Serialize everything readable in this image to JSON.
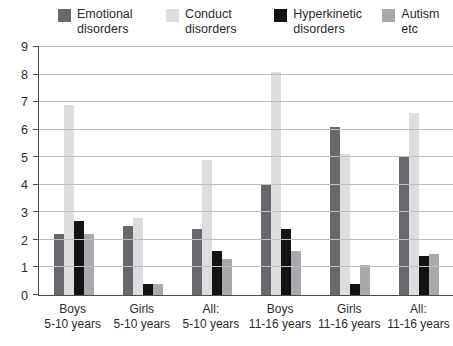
{
  "figure": {
    "background": "#ffffff",
    "text_color": "#2b2b2b",
    "grid_color": "#bdbfc1",
    "axis_color": "#4c4c4e"
  },
  "chart_data": {
    "type": "bar",
    "title": "",
    "xlabel": "",
    "ylabel": "",
    "grid": true,
    "legend_position": "top",
    "ylim": [
      0,
      9
    ],
    "yticks": [
      0,
      1,
      2,
      3,
      4,
      5,
      6,
      7,
      8,
      9
    ],
    "categories": [
      [
        "Boys",
        "5-10 years"
      ],
      [
        "Girls",
        "5-10 years"
      ],
      [
        "All:",
        "5-10 years"
      ],
      [
        "Boys",
        "11-16 years"
      ],
      [
        "Girls",
        "11-16 years"
      ],
      [
        "All:",
        "11-16 years"
      ]
    ],
    "series": [
      {
        "name": "Emotional disorders",
        "color": "#67696c",
        "values": [
          2.2,
          2.5,
          2.4,
          4.0,
          6.1,
          5.0
        ]
      },
      {
        "name": "Conduct disorders",
        "color": "#dcddde",
        "values": [
          6.9,
          2.8,
          4.9,
          8.1,
          5.1,
          6.6
        ]
      },
      {
        "name": "Hyperkinetic disorders",
        "color": "#131313",
        "values": [
          2.7,
          0.4,
          1.6,
          2.4,
          0.4,
          1.4
        ]
      },
      {
        "name": "Autism etc",
        "color": "#a7a9ac",
        "values": [
          2.2,
          0.4,
          1.3,
          1.6,
          1.1,
          1.5
        ]
      }
    ]
  }
}
